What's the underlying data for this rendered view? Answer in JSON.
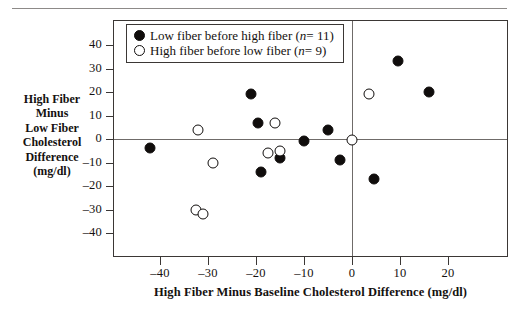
{
  "chart_data": {
    "type": "scatter",
    "title": "",
    "xlabel": "High Fiber Minus Baseline Cholesterol Difference (mg/dl)",
    "ylabel": "High Fiber Minus Low Fiber Cholesterol Difference (mg/dl)",
    "xlim": [
      -48,
      28
    ],
    "ylim": [
      -46,
      46
    ],
    "xticks": [
      -40,
      -30,
      -20,
      -10,
      0,
      10,
      20
    ],
    "xtick_labels": [
      "–40",
      "–30",
      "–20",
      "–10",
      "0",
      "10",
      "20"
    ],
    "yticks": [
      40,
      30,
      20,
      10,
      0,
      -10,
      -20,
      -30,
      -40
    ],
    "ytick_labels": [
      "40",
      "30",
      "20",
      "10",
      "0",
      "–10",
      "–20",
      "–30",
      "–40"
    ],
    "grid": false,
    "reference_lines": [
      {
        "axis": "y",
        "value": 0
      },
      {
        "axis": "x",
        "value": 0
      }
    ],
    "legend_position": "top-left",
    "series": [
      {
        "name": "Low fiber before high fiber",
        "marker": "filled-circle",
        "n": 11,
        "points": [
          {
            "x": -42.0,
            "y": -4.0
          },
          {
            "x": -21.0,
            "y": 19.0
          },
          {
            "x": -19.5,
            "y": 7.0
          },
          {
            "x": -19.0,
            "y": -14.0
          },
          {
            "x": -15.0,
            "y": -8.0
          },
          {
            "x": -10.0,
            "y": -1.0
          },
          {
            "x": -5.0,
            "y": 4.0
          },
          {
            "x": -2.5,
            "y": -9.0
          },
          {
            "x": 4.5,
            "y": -17.0
          },
          {
            "x": 9.5,
            "y": 33.0
          },
          {
            "x": 16.0,
            "y": 20.0
          }
        ]
      },
      {
        "name": "High fiber before low fiber",
        "marker": "open-circle",
        "n": 9,
        "points": [
          {
            "x": -32.5,
            "y": -30.0
          },
          {
            "x": -32.0,
            "y": 4.0
          },
          {
            "x": -31.0,
            "y": -32.0
          },
          {
            "x": -29.0,
            "y": -10.0
          },
          {
            "x": -17.5,
            "y": -6.0
          },
          {
            "x": -16.0,
            "y": 7.0
          },
          {
            "x": -15.0,
            "y": -5.0
          },
          {
            "x": 0.0,
            "y": -0.5
          },
          {
            "x": 3.5,
            "y": 19.0
          }
        ]
      }
    ]
  },
  "legend": {
    "items": [
      {
        "label_main": "Low fiber before high fiber (",
        "n_var": "n",
        "n_eq": " = 11)",
        "marker": "filled"
      },
      {
        "label_main": "High fiber before low fiber (",
        "n_var": "n",
        "n_eq": " = 9)",
        "marker": "open"
      }
    ]
  },
  "axis_titles": {
    "y_lines": [
      "High Fiber",
      "Minus",
      "Low Fiber",
      "Cholesterol",
      "Difference",
      "(mg/dl)"
    ],
    "x": "High Fiber Minus Baseline Cholesterol Difference (mg/dl)"
  }
}
